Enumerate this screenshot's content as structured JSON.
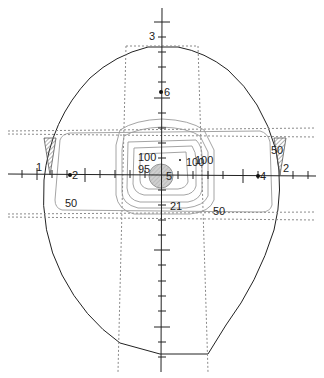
{
  "diagram": {
    "type": "radiotherapy isodose plan (transverse head contour)",
    "axis_labels": {
      "top": "3",
      "left": "1",
      "right": "2"
    },
    "point_markers": [
      {
        "id": "6",
        "label": "6"
      },
      {
        "id": "2",
        "label": "2"
      },
      {
        "id": "4",
        "label": "4"
      },
      {
        "id": "5",
        "label": "5"
      }
    ],
    "isodose_labels": {
      "center_100": "100",
      "center_95": "95",
      "right_100a": "100",
      "right_100b": "100",
      "bottom_21": "21",
      "left_50": "50",
      "bottom_right_50": "50",
      "right_wedge_50": "50"
    },
    "colors": {
      "contour": "#222222",
      "isodose": "#8a8a8a",
      "field_edge": "#8a8a8a",
      "axis": "#222222",
      "wedge": "#6a6a6a"
    }
  }
}
